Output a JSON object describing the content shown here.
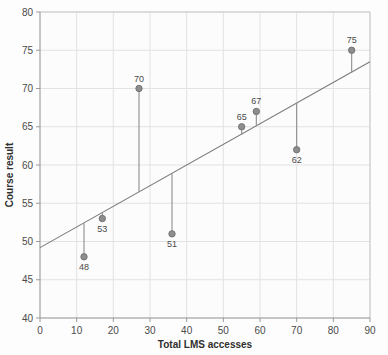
{
  "chart_data": {
    "type": "scatter",
    "title": "",
    "subtitle": "",
    "xlabel": "Total LMS accesses",
    "ylabel": "Course result",
    "xlim": [
      0,
      90
    ],
    "ylim": [
      40,
      80
    ],
    "xticks": [
      0,
      10,
      20,
      30,
      40,
      50,
      60,
      70,
      80,
      90
    ],
    "yticks": [
      40,
      45,
      50,
      55,
      60,
      65,
      70,
      75,
      80
    ],
    "xtick_labels": [
      "0",
      "10",
      "20",
      "30",
      "40",
      "50",
      "60",
      "70",
      "80",
      "90"
    ],
    "ytick_labels": [
      "40",
      "45",
      "50",
      "55",
      "60",
      "65",
      "70",
      "75",
      "80"
    ],
    "grid": true,
    "legend": "none",
    "series": [
      {
        "name": "Observations",
        "point_labels": [
          "48",
          "53",
          "70",
          "51",
          "65",
          "67",
          "62",
          "75"
        ],
        "x": [
          12,
          17,
          27,
          36,
          55,
          59,
          70,
          85
        ],
        "y": [
          48,
          53,
          70,
          51,
          65,
          67,
          62,
          75
        ],
        "label_positions": [
          "below",
          "below",
          "above",
          "below",
          "above",
          "above",
          "below",
          "above"
        ]
      },
      {
        "name": "Regression line",
        "type": "line",
        "x": [
          0,
          90
        ],
        "y": [
          49.2,
          73.5
        ]
      }
    ],
    "residual_lines": [
      {
        "x": 12,
        "y_point": 48,
        "y_fit": 52.4
      },
      {
        "x": 17,
        "y_point": 53,
        "y_fit": 53.8
      },
      {
        "x": 27,
        "y_point": 70,
        "y_fit": 56.5
      },
      {
        "x": 36,
        "y_point": 51,
        "y_fit": 58.9
      },
      {
        "x": 55,
        "y_point": 65,
        "y_fit": 64.0
      },
      {
        "x": 59,
        "y_point": 67,
        "y_fit": 65.1
      },
      {
        "x": 70,
        "y_point": 62,
        "y_fit": 68.1
      },
      {
        "x": 85,
        "y_point": 75,
        "y_fit": 72.1
      }
    ],
    "colors": {
      "marker": "#8d8d8d",
      "marker_edge": "#6f6f6f",
      "residual_line": "#8d8d8d",
      "regression_line": "#7a7a7a",
      "grid": "#e2e2e2",
      "axis": "#9a9a9a",
      "background": "#fdfdfd",
      "text": "#4a4a4a"
    }
  }
}
